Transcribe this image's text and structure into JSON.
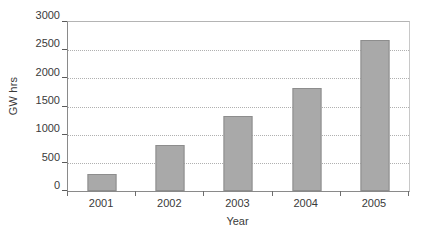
{
  "chart_data": {
    "type": "bar",
    "title": "",
    "subtitle": "",
    "xlabel": "Year",
    "ylabel": "GW hrs",
    "categories": [
      "2001",
      "2002",
      "2003",
      "2004",
      "2005"
    ],
    "values": [
      310,
      815,
      1340,
      1830,
      2680
    ],
    "series": [
      {
        "name": "GW hrs",
        "values": [
          310,
          815,
          1340,
          1830,
          2680
        ]
      }
    ],
    "ylim": [
      0,
      3000
    ],
    "ytick_labels": [
      "0",
      "500",
      "1000",
      "1500",
      "2000",
      "2500",
      "3000"
    ],
    "ytick_values": [
      0,
      500,
      1000,
      1500,
      2000,
      2500,
      3000
    ],
    "ytick_step": 500,
    "grid": "horizontal-dotted",
    "legend": "none",
    "legend_position": "none",
    "annotations": [],
    "bar_color": "#a9a9a9",
    "bar_border_color": "#8d8d8d",
    "gridline_color": "#b0b0b0",
    "axis_color": "#8a8a8a",
    "background_color": "#ffffff"
  }
}
